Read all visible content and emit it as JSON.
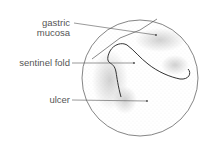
{
  "diagram": {
    "labels": {
      "gastric_mucosa_line1": "gastric",
      "gastric_mucosa_line2": "mucosa",
      "sentinel_fold": "sentinel fold",
      "ulcer": "ulcer"
    },
    "colors": {
      "line": "#555555",
      "stipple": "#9a9a9a",
      "text": "#555555"
    }
  }
}
